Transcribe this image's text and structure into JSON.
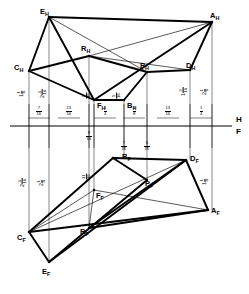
{
  "figure": {
    "type": "descriptive-geometry-orthographic-projection",
    "reference_line": {
      "upper_label": "H",
      "lower_label": "F",
      "y": 126
    },
    "views": {
      "horizontal": {
        "label": "H",
        "position": "above-fold-line"
      },
      "frontal": {
        "label": "F",
        "position": "below-fold-line"
      }
    }
  },
  "points": {
    "horizontal_view": [
      {
        "id": "E_H",
        "letter": "E",
        "sub": "H",
        "x": 49,
        "y": 17,
        "label_x": 40,
        "label_y": 8
      },
      {
        "id": "A_H",
        "letter": "A",
        "sub": "H",
        "x": 212,
        "y": 22,
        "label_x": 210,
        "label_y": 12
      },
      {
        "id": "R_H",
        "letter": "R",
        "sub": "H",
        "x": 89,
        "y": 56,
        "label_x": 81,
        "label_y": 45
      },
      {
        "id": "C_H",
        "letter": "C",
        "sub": "H",
        "x": 29,
        "y": 71,
        "label_x": 14,
        "label_y": 64
      },
      {
        "id": "P_H",
        "letter": "P",
        "sub": "H",
        "x": 147,
        "y": 72,
        "label_x": 140,
        "label_y": 62
      },
      {
        "id": "D_H",
        "letter": "D",
        "sub": "H",
        "x": 190,
        "y": 70,
        "label_x": 186,
        "label_y": 62
      },
      {
        "id": "F_H",
        "letter": "F",
        "sub": "H",
        "x": 94,
        "y": 100,
        "label_x": 97,
        "label_y": 102
      },
      {
        "id": "B_H",
        "letter": "B",
        "sub": "H",
        "x": 124,
        "y": 100,
        "label_x": 127,
        "label_y": 102
      }
    ],
    "frontal_view": [
      {
        "id": "B_F",
        "letter": "B",
        "sub": "F",
        "x": 113,
        "y": 158,
        "label_x": 122,
        "label_y": 153
      },
      {
        "id": "D_F",
        "letter": "D",
        "sub": "F",
        "x": 186,
        "y": 160,
        "label_x": 190,
        "label_y": 155
      },
      {
        "id": "P_F",
        "letter": "P",
        "sub": "F",
        "x": 147,
        "y": 180,
        "label_x": 145,
        "label_y": 180
      },
      {
        "id": "F_F",
        "letter": "F",
        "sub": "F",
        "x": 94,
        "y": 190,
        "label_x": 96,
        "label_y": 192
      },
      {
        "id": "A_F",
        "letter": "A",
        "sub": "F",
        "x": 208,
        "y": 210,
        "label_x": 211,
        "label_y": 207
      },
      {
        "id": "R_F",
        "letter": "R",
        "sub": "F",
        "x": 89,
        "y": 228,
        "label_x": 80,
        "label_y": 228
      },
      {
        "id": "C_F",
        "letter": "C",
        "sub": "F",
        "x": 29,
        "y": 232,
        "label_x": 17,
        "label_y": 234
      },
      {
        "id": "E_F",
        "letter": "E",
        "sub": "F",
        "x": 49,
        "y": 262,
        "label_x": 42,
        "label_y": 268
      }
    ]
  },
  "projectors": [
    {
      "name": "projector-C",
      "x": 29,
      "y1": 71,
      "y2": 232
    },
    {
      "name": "projector-E",
      "x": 49,
      "y1": 17,
      "y2": 262
    },
    {
      "name": "projector-F",
      "x": 94,
      "y1": 100,
      "y2": 190
    },
    {
      "name": "projector-R",
      "x": 89,
      "y1": 56,
      "y2": 228
    },
    {
      "name": "projector-B",
      "x": 124,
      "y1": 100,
      "y2": 158
    },
    {
      "name": "projector-P",
      "x": 147,
      "y1": 72,
      "y2": 180
    },
    {
      "name": "projector-D",
      "x": 190,
      "y1": 70,
      "y2": 160
    },
    {
      "name": "projector-A",
      "x": 212,
      "y1": 22,
      "y2": 210
    }
  ],
  "edges_horizontal": [
    {
      "from": "E_H",
      "to": "A_H",
      "weight": "thick"
    },
    {
      "from": "E_H",
      "to": "C_H",
      "weight": "thick"
    },
    {
      "from": "E_H",
      "to": "F_H",
      "weight": "thick"
    },
    {
      "from": "E_H",
      "to": "P_H",
      "weight": "thin"
    },
    {
      "from": "A_H",
      "to": "D_H",
      "weight": "thick"
    },
    {
      "from": "A_H",
      "to": "F_H",
      "weight": "thick"
    },
    {
      "from": "A_H",
      "to": "R_H",
      "weight": "thin"
    },
    {
      "from": "C_H",
      "to": "R_H",
      "weight": "thick"
    },
    {
      "from": "C_H",
      "to": "F_H",
      "weight": "thick"
    },
    {
      "from": "R_H",
      "to": "D_H",
      "weight": "thin"
    },
    {
      "from": "R_H",
      "to": "P_H",
      "weight": "thick"
    },
    {
      "from": "P_H",
      "to": "D_H",
      "weight": "thick"
    },
    {
      "from": "P_H",
      "to": "B_H",
      "weight": "thick"
    },
    {
      "from": "F_H",
      "to": "B_H",
      "weight": "thick"
    }
  ],
  "edges_frontal": [
    {
      "from": "C_F",
      "to": "B_F",
      "weight": "thick"
    },
    {
      "from": "C_F",
      "to": "E_F",
      "weight": "thick"
    },
    {
      "from": "C_F",
      "to": "A_F",
      "weight": "thick"
    },
    {
      "from": "C_F",
      "to": "D_F",
      "weight": "thin"
    },
    {
      "from": "B_F",
      "to": "D_F",
      "weight": "thick"
    },
    {
      "from": "B_F",
      "to": "P_F",
      "weight": "thick"
    },
    {
      "from": "D_F",
      "to": "A_F",
      "weight": "thick"
    },
    {
      "from": "D_F",
      "to": "R_F",
      "weight": "thick"
    },
    {
      "from": "E_F",
      "to": "D_F",
      "weight": "thick"
    },
    {
      "from": "E_F",
      "to": "P_F",
      "weight": "thick"
    },
    {
      "from": "F_F",
      "to": "A_F",
      "weight": "thin"
    },
    {
      "from": "R_F",
      "to": "A_F",
      "weight": "thick"
    },
    {
      "from": "R_F",
      "to": "F_F",
      "weight": "thin"
    },
    {
      "from": "C_F",
      "to": "F_F",
      "weight": "thin"
    }
  ],
  "dimensions_above_line": [
    {
      "name": "dim-C-to-E",
      "whole": "",
      "num": "7",
      "den": "16",
      "x": 39,
      "y": 111
    },
    {
      "name": "dim-E-to-R",
      "whole": "",
      "num": "13",
      "den": "16",
      "x": 69,
      "y": 111
    },
    {
      "name": "dim-R-to-F",
      "whole": "",
      "num": "1",
      "den": "4",
      "x": 105,
      "y": 111
    },
    {
      "name": "dim-F-to-B",
      "whole": "",
      "num": "1",
      "den": "8",
      "x": 134,
      "y": 111
    },
    {
      "name": "dim-B-to-P",
      "whole": "",
      "num": "13",
      "den": "16",
      "x": 168,
      "y": 111
    },
    {
      "name": "dim-P-to-A",
      "whole": "",
      "num": "1",
      "den": "4",
      "x": 201,
      "y": 111
    }
  ],
  "dimensions_below_line": [
    {
      "name": "dim-below-R",
      "whole": "",
      "num": "9",
      "den": "16",
      "x": 89,
      "y": 136
    },
    {
      "name": "dim-below-B",
      "whole": "",
      "num": "7",
      "den": "16",
      "x": 124,
      "y": 146
    },
    {
      "name": "dim-below-P",
      "whole": "",
      "num": "5",
      "den": "16",
      "x": 147,
      "y": 146
    }
  ],
  "dimensions_vertical_left_upper": [
    {
      "name": "dim-C-height",
      "whole": "1",
      "num": "1",
      "den": "8",
      "x": 22,
      "y": 93
    },
    {
      "name": "dim-E-height",
      "whole": "2",
      "num": "3",
      "den": "16",
      "x": 42,
      "y": 93
    },
    {
      "name": "dim-F-height",
      "whole": "",
      "num": "9",
      "den": "16",
      "x": 87,
      "y": 95
    },
    {
      "name": "dim-B-height",
      "whole": "",
      "num": "5",
      "den": "16",
      "x": 117,
      "y": 95
    }
  ],
  "dimensions_vertical_right_upper": [
    {
      "name": "dim-D-height",
      "whole": "1",
      "num": "9",
      "den": "16",
      "x": 183,
      "y": 91
    },
    {
      "name": "dim-A-height",
      "whole": "2",
      "num": "1",
      "den": "8",
      "x": 205,
      "y": 91
    }
  ],
  "dimensions_vertical_left_lower": [
    {
      "name": "dim-C-depth",
      "whole": "2",
      "num": "3",
      "den": "16",
      "x": 22,
      "y": 182
    },
    {
      "name": "dim-E-depth",
      "whole": "2",
      "num": "1",
      "den": "8",
      "x": 42,
      "y": 182
    },
    {
      "name": "dim-F-depth",
      "whole": "",
      "num": "11",
      "den": "16",
      "x": 87,
      "y": 176
    }
  ],
  "dimensions_vertical_right_lower": [
    {
      "name": "dim-A-depth",
      "whole": "1",
      "num": "1",
      "den": "8",
      "x": 205,
      "y": 181
    }
  ],
  "colors": {
    "line": "#000000",
    "background": "#ffffff"
  }
}
